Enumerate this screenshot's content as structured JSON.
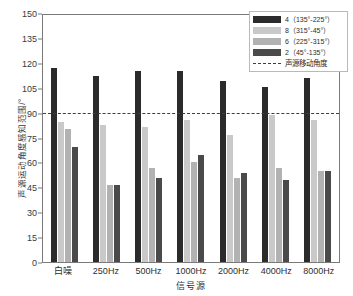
{
  "chart_data": {
    "type": "bar",
    "title": "",
    "subtitle": "",
    "xlabel": "信号源",
    "ylabel": "声源运动角度感知范围/°",
    "ylim": [
      0,
      150
    ],
    "ytick_step": 15,
    "yticks": [
      "150",
      "135",
      "120",
      "105",
      "90",
      "75",
      "60",
      "45",
      "30",
      "15",
      "0"
    ],
    "grid": false,
    "legend_position": "top-right",
    "categories": [
      "白噪",
      "250Hz",
      "500Hz",
      "1000Hz",
      "2000Hz",
      "4000Hz",
      "8000Hz"
    ],
    "series": [
      {
        "name": "4（135°-225°）",
        "color": "#2b2b2b",
        "values": [
          118,
          113,
          116,
          116,
          110,
          106,
          112
        ]
      },
      {
        "name": "8（315°-45°）",
        "color": "#c9c9c9",
        "values": [
          85,
          83,
          82,
          86,
          77,
          89,
          86
        ]
      },
      {
        "name": "6（225°-315°）",
        "color": "#b2b2b2",
        "values": [
          81,
          47,
          57,
          61,
          51,
          57,
          55
        ]
      },
      {
        "name": "2（45°-135°）",
        "color": "#4a4a4a",
        "values": [
          70,
          47,
          51,
          65,
          54,
          50,
          55
        ]
      }
    ],
    "reference_line": {
      "label": "声源移动角度",
      "value": 90,
      "style": "dashed",
      "color": "#3d3d3d"
    }
  },
  "legend": {
    "entries": [
      {
        "label": "4（135°-225°）",
        "swatch": "#2b2b2b"
      },
      {
        "label": "8（315°-45°）",
        "swatch": "#c9c9c9"
      },
      {
        "label": "6（225°-315°）",
        "swatch": "#b2b2b2"
      },
      {
        "label": "2（45°-135°）",
        "swatch": "#4a4a4a"
      }
    ],
    "reference_label": "声源移动角度"
  },
  "colors": {
    "axis": "#7a7a7a",
    "text": "#2e2e2e",
    "background": "#ffffff"
  }
}
